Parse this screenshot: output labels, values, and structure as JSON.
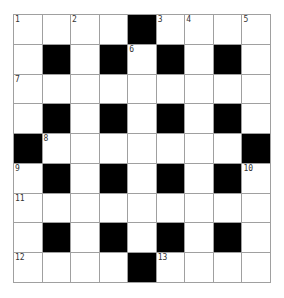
{
  "puzzle": {
    "rows": 9,
    "cols": 9,
    "grid": [
      "....#....",
      ".#.#.#.#.",
      ".........",
      ".#.#.#.#.",
      "#.......#",
      ".#.#.#.#.",
      ".........",
      ".#.#.#.#.",
      "....#...."
    ],
    "numbers": [
      {
        "row": 0,
        "col": 0,
        "n": "1"
      },
      {
        "row": 0,
        "col": 2,
        "n": "2"
      },
      {
        "row": 0,
        "col": 5,
        "n": "3"
      },
      {
        "row": 0,
        "col": 6,
        "n": "4"
      },
      {
        "row": 0,
        "col": 8,
        "n": "5"
      },
      {
        "row": 1,
        "col": 4,
        "n": "6"
      },
      {
        "row": 2,
        "col": 0,
        "n": "7"
      },
      {
        "row": 4,
        "col": 1,
        "n": "8"
      },
      {
        "row": 5,
        "col": 0,
        "n": "9"
      },
      {
        "row": 5,
        "col": 8,
        "n": "10"
      },
      {
        "row": 6,
        "col": 0,
        "n": "11"
      },
      {
        "row": 8,
        "col": 0,
        "n": "12"
      },
      {
        "row": 8,
        "col": 5,
        "n": "13"
      }
    ],
    "colors": {
      "block": "#000000",
      "cell": "#ffffff",
      "gridline": "#a0a0a0",
      "number": "#333333"
    }
  }
}
